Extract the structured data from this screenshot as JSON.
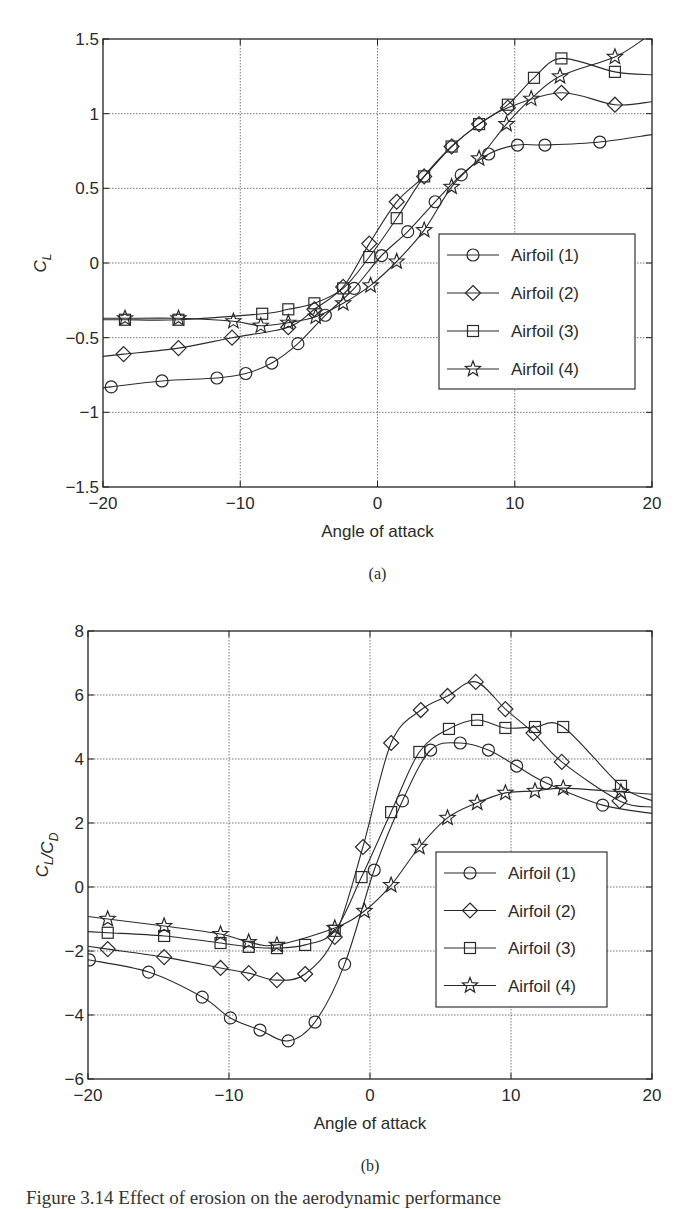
{
  "figure": {
    "caption": "Figure 3.14  Effect of erosion on the aerodynamic performance"
  },
  "chart_data": [
    {
      "id": "a",
      "type": "line",
      "panel_label": "(a)",
      "title": "",
      "xlabel": "Angle of attack",
      "ylabel": "C_L",
      "xlim": [
        -20,
        20
      ],
      "ylim": [
        -1.5,
        1.5
      ],
      "xticks": [
        -20,
        -10,
        0,
        10,
        20
      ],
      "xtick_labels": [
        "−20",
        "−10",
        "0",
        "10",
        "20"
      ],
      "yticks": [
        -1.5,
        -1,
        -0.5,
        0,
        0.5,
        1,
        1.5
      ],
      "ytick_labels": [
        "−1.5",
        "−1",
        "−0.5",
        "0",
        "0.5",
        "1",
        "1.5"
      ],
      "grid": true,
      "legend_position": "lower right (inside)",
      "series": [
        {
          "name": "Airfoil (1)",
          "marker": "circle",
          "x": [
            -19.4,
            -15.7,
            -11.7,
            -9.6,
            -7.7,
            -5.8,
            -3.8,
            -1.7,
            0.3,
            2.2,
            4.2,
            6.1,
            8.1,
            10.2,
            12.2,
            16.2
          ],
          "y": [
            -0.83,
            -0.79,
            -0.77,
            -0.74,
            -0.67,
            -0.54,
            -0.35,
            -0.17,
            0.05,
            0.21,
            0.41,
            0.59,
            0.73,
            0.79,
            0.79,
            0.81
          ],
          "line_end": [
            20,
            0.86
          ]
        },
        {
          "name": "Airfoil (2)",
          "marker": "diamond",
          "x": [
            -18.5,
            -14.5,
            -10.6,
            -6.5,
            -4.6,
            -2.5,
            -0.6,
            1.4,
            3.4,
            5.4,
            7.4,
            9.5,
            13.4,
            17.3
          ],
          "y": [
            -0.61,
            -0.57,
            -0.5,
            -0.43,
            -0.31,
            -0.16,
            0.13,
            0.41,
            0.58,
            0.78,
            0.93,
            1.04,
            1.14,
            1.06
          ],
          "line_end": [
            20,
            1.08
          ]
        },
        {
          "name": "Airfoil (3)",
          "marker": "square",
          "x": [
            -18.4,
            -14.5,
            -8.4,
            -6.5,
            -4.6,
            -2.5,
            -0.6,
            1.4,
            3.4,
            5.4,
            7.4,
            9.5,
            11.4,
            13.4,
            17.3
          ],
          "y": [
            -0.38,
            -0.38,
            -0.34,
            -0.31,
            -0.27,
            -0.17,
            0.04,
            0.3,
            0.58,
            0.78,
            0.93,
            1.06,
            1.24,
            1.37,
            1.28
          ],
          "line_end": [
            20,
            1.26
          ]
        },
        {
          "name": "Airfoil (4)",
          "marker": "star",
          "x": [
            -18.4,
            -14.5,
            -10.5,
            -8.5,
            -6.5,
            -4.5,
            -2.5,
            -0.5,
            1.4,
            3.4,
            5.4,
            7.4,
            9.4,
            11.2,
            13.3,
            17.3
          ],
          "y": [
            -0.37,
            -0.37,
            -0.39,
            -0.42,
            -0.4,
            -0.36,
            -0.27,
            -0.15,
            0.01,
            0.22,
            0.51,
            0.7,
            0.93,
            1.1,
            1.25,
            1.38
          ],
          "line_end": [
            19.4,
            1.5
          ]
        }
      ]
    },
    {
      "id": "b",
      "type": "line",
      "panel_label": "(b)",
      "title": "",
      "xlabel": "Angle of attack",
      "ylabel": "C_L/C_D",
      "xlim": [
        -20,
        20
      ],
      "ylim": [
        -6,
        8
      ],
      "xticks": [
        -20,
        -10,
        0,
        10,
        20
      ],
      "xtick_labels": [
        "−20",
        "−10",
        "0",
        "10",
        "20"
      ],
      "yticks": [
        -6,
        -4,
        -2,
        0,
        2,
        4,
        6,
        8
      ],
      "ytick_labels": [
        "−6",
        "−4",
        "−2",
        "0",
        "2",
        "4",
        "6",
        "8"
      ],
      "grid": true,
      "legend_position": "lower right (inside)",
      "series": [
        {
          "name": "Airfoil (1)",
          "marker": "circle",
          "x": [
            -19.9,
            -15.7,
            -11.9,
            -9.9,
            -7.8,
            -5.8,
            -3.9,
            -1.8,
            0.3,
            2.3,
            4.3,
            6.4,
            8.4,
            10.4,
            12.5,
            16.5
          ],
          "y": [
            -2.28,
            -2.66,
            -3.44,
            -4.09,
            -4.47,
            -4.81,
            -4.22,
            -2.41,
            0.53,
            2.69,
            4.28,
            4.5,
            4.28,
            3.78,
            3.25,
            2.56
          ],
          "line_end": [
            20,
            2.3
          ]
        },
        {
          "name": "Airfoil (2)",
          "marker": "diamond",
          "x": [
            -18.6,
            -14.6,
            -10.6,
            -8.6,
            -6.6,
            -4.6,
            -2.5,
            -0.5,
            1.5,
            3.6,
            5.5,
            7.5,
            9.6,
            11.6,
            13.6,
            17.7
          ],
          "y": [
            -1.94,
            -2.19,
            -2.53,
            -2.69,
            -2.91,
            -2.72,
            -1.56,
            1.25,
            4.5,
            5.53,
            5.97,
            6.41,
            5.56,
            4.81,
            3.91,
            2.69
          ],
          "line_end": [
            20,
            2.5
          ]
        },
        {
          "name": "Airfoil (3)",
          "marker": "square",
          "x": [
            -18.6,
            -14.6,
            -10.6,
            -8.6,
            -6.6,
            -4.6,
            -2.5,
            -0.6,
            1.5,
            3.5,
            5.6,
            7.6,
            9.6,
            11.7,
            13.7,
            17.8
          ],
          "y": [
            -1.43,
            -1.53,
            -1.75,
            -1.87,
            -1.91,
            -1.81,
            -1.37,
            0.31,
            2.34,
            4.22,
            4.94,
            5.22,
            4.97,
            5.0,
            5.0,
            3.16
          ],
          "line_end": [
            20,
            2.7
          ]
        },
        {
          "name": "Airfoil (4)",
          "marker": "star",
          "x": [
            -18.6,
            -14.6,
            -10.6,
            -8.6,
            -6.6,
            -2.5,
            -0.4,
            1.5,
            3.5,
            5.5,
            7.6,
            9.6,
            11.7,
            13.7,
            17.8
          ],
          "y": [
            -1.0,
            -1.22,
            -1.47,
            -1.72,
            -1.81,
            -1.28,
            -0.75,
            0.06,
            1.25,
            2.16,
            2.63,
            2.94,
            3.0,
            3.09,
            2.97
          ],
          "line_end": [
            20,
            2.9
          ]
        }
      ]
    }
  ]
}
